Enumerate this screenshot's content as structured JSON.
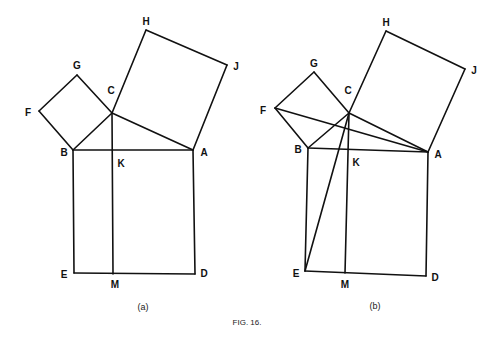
{
  "caption": "FIG. 16.",
  "figures": [
    {
      "id": "a",
      "sublabel": "(a)",
      "vertices": {
        "A": {
          "label": "A",
          "x": 193,
          "y": 150,
          "lx": 204,
          "ly": 156
        },
        "B": {
          "label": "B",
          "x": 73,
          "y": 150,
          "lx": 64,
          "ly": 156
        },
        "C": {
          "label": "C",
          "x": 112,
          "y": 113,
          "lx": 111,
          "ly": 94
        },
        "D": {
          "label": "D",
          "x": 195,
          "y": 274,
          "lx": 204,
          "ly": 277
        },
        "E": {
          "label": "E",
          "x": 74,
          "y": 273,
          "lx": 64,
          "ly": 278
        },
        "F": {
          "label": "F",
          "x": 39,
          "y": 111,
          "lx": 28,
          "ly": 116
        },
        "G": {
          "label": "G",
          "x": 77,
          "y": 75,
          "lx": 77,
          "ly": 69
        },
        "H": {
          "label": "H",
          "x": 146,
          "y": 30,
          "lx": 146,
          "ly": 25
        },
        "J": {
          "label": "J",
          "x": 227,
          "y": 65,
          "lx": 236,
          "ly": 70
        },
        "K": {
          "label": "K",
          "x": 112,
          "y": 150,
          "lx": 121,
          "ly": 167
        },
        "M": {
          "label": "M",
          "x": 113,
          "y": 274,
          "lx": 115,
          "ly": 288
        }
      },
      "sublabel_pos": {
        "x": 143,
        "y": 310
      },
      "segments": [
        [
          "B",
          "A"
        ],
        [
          "A",
          "C"
        ],
        [
          "C",
          "B"
        ],
        [
          "B",
          "F"
        ],
        [
          "F",
          "G"
        ],
        [
          "G",
          "C"
        ],
        [
          "C",
          "H"
        ],
        [
          "H",
          "J"
        ],
        [
          "J",
          "A"
        ],
        [
          "B",
          "E"
        ],
        [
          "E",
          "D"
        ],
        [
          "D",
          "A"
        ],
        [
          "C",
          "M"
        ]
      ]
    },
    {
      "id": "b",
      "sublabel": "(b)",
      "vertices": {
        "A": {
          "label": "A",
          "x": 428,
          "y": 152,
          "lx": 438,
          "ly": 158
        },
        "B": {
          "label": "B",
          "x": 308,
          "y": 148,
          "lx": 298,
          "ly": 153
        },
        "C": {
          "label": "C",
          "x": 349,
          "y": 113,
          "lx": 348,
          "ly": 94
        },
        "D": {
          "label": "D",
          "x": 426,
          "y": 276,
          "lx": 435,
          "ly": 281
        },
        "E": {
          "label": "E",
          "x": 305,
          "y": 271,
          "lx": 296,
          "ly": 277
        },
        "F": {
          "label": "F",
          "x": 275,
          "y": 108,
          "lx": 263,
          "ly": 114
        },
        "G": {
          "label": "G",
          "x": 314,
          "y": 72,
          "lx": 314,
          "ly": 67
        },
        "H": {
          "label": "H",
          "x": 386,
          "y": 31,
          "lx": 386,
          "ly": 26
        },
        "J": {
          "label": "J",
          "x": 465,
          "y": 69,
          "lx": 474,
          "ly": 74
        },
        "K": {
          "label": "K",
          "x": 347,
          "y": 150,
          "lx": 356,
          "ly": 166
        },
        "M": {
          "label": "M",
          "x": 345,
          "y": 273,
          "lx": 345,
          "ly": 288
        }
      },
      "sublabel_pos": {
        "x": 375,
        "y": 309
      },
      "segments": [
        [
          "B",
          "A"
        ],
        [
          "A",
          "C"
        ],
        [
          "C",
          "B"
        ],
        [
          "B",
          "F"
        ],
        [
          "F",
          "G"
        ],
        [
          "G",
          "C"
        ],
        [
          "C",
          "H"
        ],
        [
          "H",
          "J"
        ],
        [
          "J",
          "A"
        ],
        [
          "B",
          "E"
        ],
        [
          "E",
          "D"
        ],
        [
          "D",
          "A"
        ],
        [
          "C",
          "M"
        ],
        [
          "F",
          "A"
        ],
        [
          "C",
          "E"
        ]
      ]
    }
  ],
  "caption_pos": {
    "x": 247,
    "y": 325
  }
}
